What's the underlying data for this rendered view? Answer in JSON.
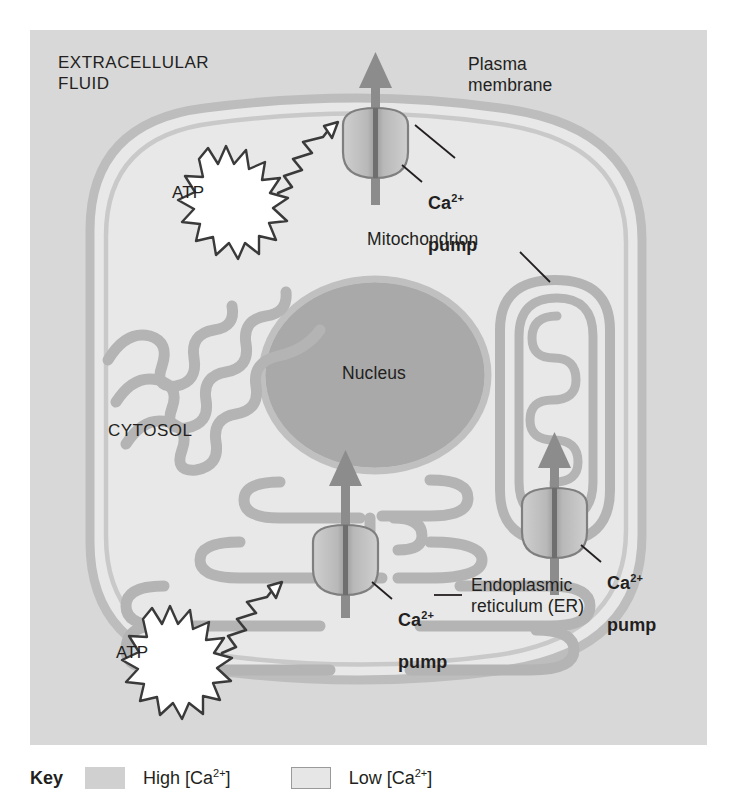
{
  "figure": {
    "type": "cell-biology-diagram",
    "topic": "Ca2+ pumps maintain low cytosolic calcium concentration",
    "regions": {
      "extracellular": "EXTRACELLULAR\nFLUID",
      "cytosol": "CYTOSOL",
      "nucleus": "Nucleus"
    },
    "labels": {
      "plasma_membrane": "Plasma\nmembrane",
      "mitochondrion": "Mitochondrion",
      "endoplasmic_reticulum": "Endoplasmic\nreticulum (ER)"
    },
    "pumps": [
      {
        "id": "plasma-membrane-pump",
        "name": "Ca",
        "charge": "2+",
        "word": "pump",
        "direction": "out-of-cell"
      },
      {
        "id": "mitochondrial-pump",
        "name": "Ca",
        "charge": "2+",
        "word": "pump",
        "direction": "into-mitochondrion"
      },
      {
        "id": "er-pump",
        "name": "Ca",
        "charge": "2+",
        "word": "pump",
        "direction": "into-er"
      }
    ],
    "energy_sources": [
      {
        "id": "atp-plasma",
        "label": "ATP"
      },
      {
        "id": "atp-er",
        "label": "ATP"
      }
    ]
  },
  "key": {
    "title": "Key",
    "entries": [
      {
        "id": "high",
        "prefix": "High [Ca",
        "charge": "2+",
        "suffix": "]",
        "color": "#d0d0d0"
      },
      {
        "id": "low",
        "prefix": "Low [Ca",
        "charge": "2+",
        "suffix": "]",
        "color": "#e6e6e6"
      }
    ]
  },
  "colors": {
    "extracellular_fluid": "#d8d8d8",
    "cytosol": "#e8e8e8",
    "nucleus_fill": "#a9a9a9",
    "organelle_membrane": "#b4b4b4",
    "plasma_membrane": "#bdbdbd",
    "arrow": "#8c8c8c",
    "pump_body": "#c4c4c4",
    "text": "#231f20"
  }
}
